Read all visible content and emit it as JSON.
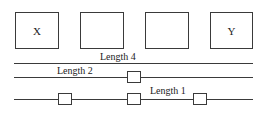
{
  "diagram": {
    "top_boxes": [
      {
        "label": "X"
      },
      {
        "label": ""
      },
      {
        "label": ""
      },
      {
        "label": "Y"
      }
    ],
    "lines": [
      {
        "label": "Length 4"
      },
      {
        "label": "Length 2"
      },
      {
        "label": "Length 1"
      }
    ],
    "colors": {
      "stroke": "#3a3a3a",
      "background": "#ffffff"
    }
  }
}
